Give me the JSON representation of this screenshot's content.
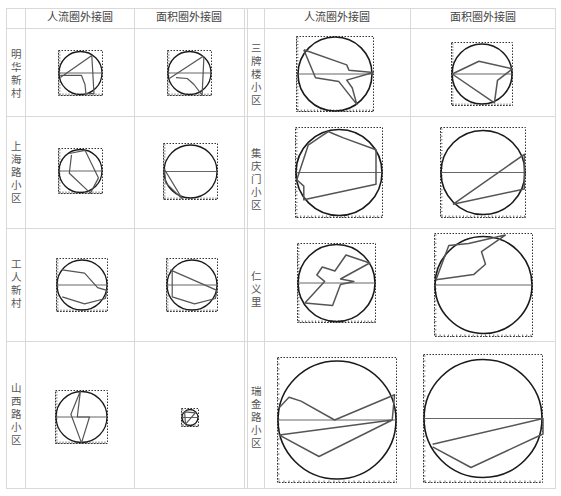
{
  "headers": {
    "left_col1": "人流圈外接圆",
    "left_col2": "面积圈外接圆",
    "right_col1": "人流圈外接圆",
    "right_col2": "面积圈外接圆"
  },
  "rows_left": [
    {
      "label": "明华新村"
    },
    {
      "label": "上海路小区"
    },
    {
      "label": "工人新村"
    },
    {
      "label": "山西路小区"
    }
  ],
  "rows_right": [
    {
      "label": "三牌楼小区"
    },
    {
      "label": "集庆门小区"
    },
    {
      "label": "仁义里"
    },
    {
      "label": "瑞金路小区"
    }
  ],
  "colors": {
    "grid_line": "#d9d9d9",
    "circle": "#1a1a1a",
    "polygon": "#555555",
    "frame": "#333333"
  },
  "figures": [
    {
      "id": "minghua-flow",
      "x": 58,
      "y": 50,
      "w": 45,
      "h": 46,
      "poly": "0.05,0.6 0.75,0.12 0.8,0.95 0.62,0.95 0.6,0.75 0.52,0.55 0.05,0.55"
    },
    {
      "id": "minghua-area",
      "x": 167,
      "y": 50,
      "w": 45,
      "h": 46,
      "poly": "0.05,0.62 0.78,0.15 0.82,0.15 0.78,0.98 0.6,0.75 0.45,0.62 0.2,0.6"
    },
    {
      "id": "shanghai-flow",
      "x": 58,
      "y": 148,
      "w": 45,
      "h": 46,
      "poly": "0.25,0.12 0.6,0.05 0.9,0.65 0.72,0.98 0.25,0.55 0.3,0.15"
    },
    {
      "id": "shanghai-area",
      "x": 163,
      "y": 143,
      "w": 55,
      "h": 57,
      "poly": "0.02,0.45 0.35,0.98 0.05,0.7 0.03,0.5"
    },
    {
      "id": "gongren-flow",
      "x": 56,
      "y": 258,
      "w": 52,
      "h": 54,
      "poly": "0.12,0.22 0.55,0.28 0.8,0.55 0.98,0.6 0.95,0.75 0.55,0.85 0.12,0.72"
    },
    {
      "id": "gongren-area",
      "x": 166,
      "y": 258,
      "w": 52,
      "h": 54,
      "poly": "0.08,0.22 0.98,0.6 0.95,0.75 0.55,0.85 0.12,0.72 0.12,0.22"
    },
    {
      "id": "shanxi-flow",
      "x": 55,
      "y": 390,
      "w": 53,
      "h": 54,
      "poly": "0.48,0.02 0.3,0.45 0.5,0.98 0.65,0.5 0.42,0.5 0.48,0.02"
    },
    {
      "id": "shanxi-area",
      "x": 181,
      "y": 408,
      "w": 18,
      "h": 19,
      "poly": "0.2,0.2 0.8,0.25 0.25,0.85 0.2,0.2"
    }
  ],
  "figures_right": [
    {
      "id": "sanpailou-flow",
      "x": 296,
      "y": 36,
      "w": 78,
      "h": 76,
      "poly": "0.1,0.18 0.65,0.38 0.68,0.45 0.99,0.48 0.65,0.58 0.72,0.68 0.78,0.9 0.55,0.6 0.25,0.55 0.1,0.18"
    },
    {
      "id": "sanpailou-area",
      "x": 451,
      "y": 42,
      "w": 62,
      "h": 64,
      "poly": "0.02,0.5 0.45,0.3 0.99,0.42 0.75,0.6 0.7,0.95 0.02,0.5"
    },
    {
      "id": "jiqing-flow",
      "x": 295,
      "y": 127,
      "w": 88,
      "h": 91,
      "poly": "0.3,0.1 0.38,0.05 0.45,0.08 0.55,0.12 0.92,0.25 0.92,0.63 0.1,0.8 0.1,0.65 0.02,0.58 0.15,0.2 0.3,0.1"
    },
    {
      "id": "jiqing-area",
      "x": 440,
      "y": 127,
      "w": 86,
      "h": 91,
      "poly": "0.15,0.85 0.98,0.3 0.98,0.68 0.15,0.85"
    },
    {
      "id": "renyili-flow",
      "x": 297,
      "y": 243,
      "w": 79,
      "h": 80,
      "poly": "0.1,0.75 0.35,0.48 0.25,0.4 0.32,0.3 0.48,0.35 0.62,0.15 0.92,0.25 0.55,0.45 0.72,0.48 0.55,0.52 0.45,0.78 0.1,0.75"
    },
    {
      "id": "renyili-area",
      "x": 434,
      "y": 233,
      "w": 99,
      "h": 104,
      "poly": "0.02,0.45 0.4,0.4 0.52,0.3 0.48,0.18 0.72,0.02 0.35,0.1 0.15,0.12 0.02,0.45"
    },
    {
      "id": "ruijin-flow",
      "x": 277,
      "y": 357,
      "w": 120,
      "h": 126,
      "poly": "0.02,0.4 0.1,0.32 0.2,0.35 0.48,0.5 0.98,0.3 0.96,0.5 0.02,0.62 0.35,0.79 0.96,0.5"
    },
    {
      "id": "ruijin-area",
      "x": 423,
      "y": 354,
      "w": 120,
      "h": 129,
      "poly": "0.08,0.7 1.0,0.5 1.0,0.62 0.4,0.88 0.08,0.72"
    }
  ]
}
